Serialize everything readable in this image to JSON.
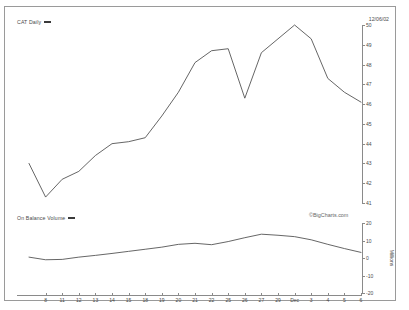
{
  "header": {
    "price_legend": "CAT Daily",
    "obv_legend": "On Balance Volume",
    "quote_date": "12/06/02",
    "watermark": "©BigCharts.com",
    "volume_units": "Millions"
  },
  "chart_data": [
    {
      "type": "line",
      "title": "CAT Daily",
      "xlabel": "",
      "ylabel": "",
      "ylim": [
        41,
        50
      ],
      "yticks": [
        50,
        49,
        48,
        47,
        46,
        45,
        44,
        43,
        42,
        41
      ],
      "grid": false,
      "legend": "CAT Daily",
      "x": [
        "8",
        "11",
        "12",
        "13",
        "14",
        "15",
        "18",
        "19",
        "20",
        "21",
        "22",
        "25",
        "26",
        "27",
        "29",
        "Dec",
        "3",
        "4",
        "5",
        "6"
      ],
      "series": [
        {
          "name": "CAT Daily",
          "values": [
            43.0,
            41.3,
            42.2,
            42.6,
            43.4,
            44.0,
            44.1,
            44.3,
            45.4,
            46.6,
            48.1,
            48.7,
            48.8,
            46.3,
            48.6,
            49.3,
            50.0,
            49.3,
            47.3,
            46.6,
            46.1
          ]
        }
      ]
    },
    {
      "type": "line",
      "title": "On Balance Volume",
      "xlabel": "",
      "ylabel": "Millions",
      "ylim": [
        -20,
        20
      ],
      "yticks": [
        20,
        10,
        0,
        -10,
        -20
      ],
      "grid": false,
      "legend": "On Balance Volume",
      "x": [
        "8",
        "11",
        "12",
        "13",
        "14",
        "15",
        "18",
        "19",
        "20",
        "21",
        "22",
        "25",
        "26",
        "27",
        "29",
        "Dec",
        "3",
        "4",
        "5",
        "6"
      ],
      "series": [
        {
          "name": "On Balance Volume",
          "values": [
            0.5,
            -1.0,
            -0.8,
            0.5,
            1.5,
            2.6,
            3.8,
            5.0,
            6.2,
            7.8,
            8.4,
            7.6,
            9.4,
            11.6,
            13.6,
            13.0,
            12.2,
            10.4,
            7.8,
            5.4,
            3.2
          ]
        }
      ]
    }
  ],
  "xaxis": {
    "ticks": [
      "8",
      "11",
      "12",
      "13",
      "14",
      "15",
      "18",
      "19",
      "20",
      "21",
      "22",
      "25",
      "26",
      "27",
      "29",
      "Dec",
      "3",
      "4",
      "5",
      "6"
    ]
  }
}
